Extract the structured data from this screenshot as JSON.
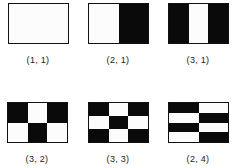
{
  "colors": {
    "dark": "#0a0a0a",
    "light": "#fcfcfc",
    "border": "#111111"
  },
  "patterns": [
    {
      "label": "(1, 1)",
      "cols": 1,
      "rows": 1,
      "cells": [
        [
          0
        ]
      ]
    },
    {
      "label": "(2, 1)",
      "cols": 2,
      "rows": 1,
      "cells": [
        [
          0,
          1
        ]
      ]
    },
    {
      "label": "(3, 1)",
      "cols": 3,
      "rows": 1,
      "cells": [
        [
          1,
          0,
          1
        ]
      ]
    },
    {
      "label": "(3, 2)",
      "cols": 3,
      "rows": 2,
      "cells": [
        [
          1,
          0,
          1
        ],
        [
          0,
          1,
          0
        ]
      ]
    },
    {
      "label": "(3, 3)",
      "cols": 3,
      "rows": 3,
      "cells": [
        [
          1,
          0,
          1
        ],
        [
          0,
          1,
          0
        ],
        [
          1,
          0,
          1
        ]
      ]
    },
    {
      "label": "(2, 4)",
      "cols": 2,
      "rows": 4,
      "cells": [
        [
          1,
          0
        ],
        [
          0,
          1
        ],
        [
          1,
          0
        ],
        [
          0,
          1
        ]
      ]
    }
  ]
}
